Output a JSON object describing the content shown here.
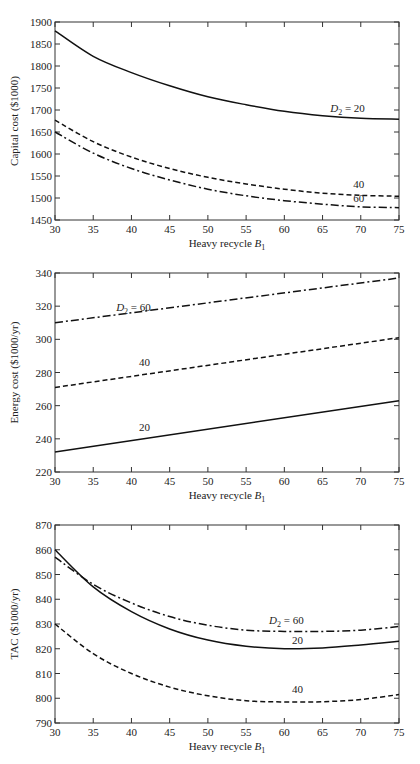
{
  "chart_data": [
    {
      "type": "line",
      "title": "",
      "xlabel": "Heavy recycle B1",
      "ylabel": "Capital cost ($1000)",
      "xlim": [
        30,
        75
      ],
      "ylim": [
        1450,
        1900
      ],
      "xticks": [
        30,
        35,
        40,
        45,
        50,
        55,
        60,
        65,
        70,
        75
      ],
      "yticks": [
        1450,
        1500,
        1550,
        1600,
        1650,
        1700,
        1750,
        1800,
        1850,
        1900
      ],
      "grid": false,
      "x": [
        30,
        35,
        40,
        45,
        50,
        55,
        60,
        65,
        70,
        75
      ],
      "series": [
        {
          "name": "D2 = 20",
          "style": "solid",
          "values": [
            1880,
            1822,
            1785,
            1755,
            1730,
            1712,
            1697,
            1687,
            1681,
            1679
          ]
        },
        {
          "name": "D2 = 40",
          "style": "dashed",
          "values": [
            1677,
            1628,
            1593,
            1567,
            1547,
            1532,
            1520,
            1511,
            1506,
            1504
          ]
        },
        {
          "name": "D2 = 60",
          "style": "dashdot",
          "values": [
            1650,
            1602,
            1567,
            1541,
            1520,
            1505,
            1494,
            1486,
            1480,
            1478
          ]
        }
      ],
      "annotations": [
        {
          "text": "D2 = 20",
          "x": 66,
          "y": 1695
        },
        {
          "text": "40",
          "x": 69,
          "y": 1522
        },
        {
          "text": "60",
          "x": 69,
          "y": 1490
        }
      ]
    },
    {
      "type": "line",
      "title": "",
      "xlabel": "Heavy recycle B1",
      "ylabel": "Energy cost ($1000/yr)",
      "xlim": [
        30,
        75
      ],
      "ylim": [
        220,
        340
      ],
      "xticks": [
        30,
        35,
        40,
        45,
        50,
        55,
        60,
        65,
        70,
        75
      ],
      "yticks": [
        220,
        240,
        260,
        280,
        300,
        320,
        340
      ],
      "grid": false,
      "x": [
        30,
        75
      ],
      "series": [
        {
          "name": "D2 = 20",
          "style": "solid",
          "values": [
            232,
            263
          ]
        },
        {
          "name": "D2 = 40",
          "style": "dashed",
          "values": [
            271,
            301
          ]
        },
        {
          "name": "D2 = 60",
          "style": "dashdot",
          "values": [
            310,
            337
          ]
        }
      ],
      "annotations": [
        {
          "text": "D2 = 60",
          "x": 38,
          "y": 317
        },
        {
          "text": "40",
          "x": 41,
          "y": 284
        },
        {
          "text": "20",
          "x": 41,
          "y": 245
        }
      ]
    },
    {
      "type": "line",
      "title": "",
      "xlabel": "Heavy recycle B1",
      "ylabel": "TAC ($1000/yr)",
      "xlim": [
        30,
        75
      ],
      "ylim": [
        790,
        870
      ],
      "xticks": [
        30,
        35,
        40,
        45,
        50,
        55,
        60,
        65,
        70,
        75
      ],
      "yticks": [
        790,
        800,
        810,
        820,
        830,
        840,
        850,
        860,
        870
      ],
      "grid": false,
      "x": [
        30,
        35,
        40,
        45,
        50,
        55,
        60,
        65,
        70,
        75
      ],
      "series": [
        {
          "name": "D2 = 20",
          "style": "solid",
          "values": [
            860,
            845,
            835,
            828,
            823.5,
            821,
            820,
            820.3,
            821.5,
            823
          ]
        },
        {
          "name": "D2 = 40",
          "style": "dashed",
          "values": [
            830,
            818,
            810,
            804.5,
            801,
            799,
            798.5,
            798.6,
            799.5,
            801.5
          ]
        },
        {
          "name": "D2 = 60",
          "style": "dashdot",
          "values": [
            857,
            846,
            838.5,
            833,
            829.5,
            827.5,
            827,
            827,
            827.5,
            829
          ]
        }
      ],
      "annotations": [
        {
          "text": "D2 = 60",
          "x": 58,
          "y": 830
        },
        {
          "text": "20",
          "x": 61,
          "y": 822
        },
        {
          "text": "40",
          "x": 61,
          "y": 802
        }
      ]
    }
  ],
  "labels": {
    "p1": {
      "ylabel": "Capital cost ($1000)",
      "ann_main": "D",
      "ann_sub": "2",
      "ann_eq": " = 20",
      "ann_40": "40",
      "ann_60": "60"
    },
    "p2": {
      "ylabel": "Energy cost ($1000/yr)",
      "ann_main": "D",
      "ann_sub": "2",
      "ann_eq": " = 60",
      "ann_40": "40",
      "ann_20": "20"
    },
    "p3": {
      "ylabel": "TAC ($1000/yr)",
      "ann_main": "D",
      "ann_sub": "2",
      "ann_eq": " = 60",
      "ann_20": "20",
      "ann_40": "40"
    },
    "xlabel_main": "Heavy recycle ",
    "xlabel_var": "B",
    "xlabel_sub": "1"
  }
}
